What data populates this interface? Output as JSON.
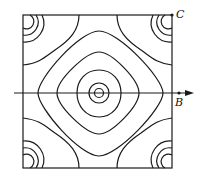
{
  "labels": {
    "c": "C",
    "b": "B"
  },
  "colors": {
    "stroke": "#1a1a1a",
    "background": "#ffffff"
  }
}
